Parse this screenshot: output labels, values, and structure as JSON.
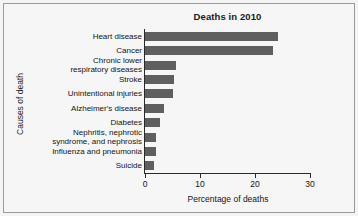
{
  "chart_data": {
    "type": "bar",
    "orientation": "horizontal",
    "title": "Deaths in 2010",
    "xlabel": "Percentage of deaths",
    "ylabel": "Causes of death",
    "categories": [
      "Heart disease",
      "Cancer",
      "Chronic lower respiratory diseases",
      "Stroke",
      "Unintentional injuries",
      "Alzheimer's disease",
      "Diabetes",
      "Nephritis, nephrotic syndrome, and nephrosis",
      "Influenza and pneumonia",
      "Suicide"
    ],
    "values": [
      24.2,
      23.3,
      5.6,
      5.3,
      5.0,
      3.4,
      2.8,
      2.0,
      2.0,
      1.6
    ],
    "xlim": [
      0,
      30
    ],
    "xticks": [
      0,
      10,
      20,
      30
    ],
    "xtick_labels": [
      "0",
      "10",
      "20",
      "30"
    ],
    "grid": false,
    "legend": false,
    "bar_color": "#5f5f5f",
    "background_color": "#f6f6f6",
    "axis_color": "#2a2a2a"
  },
  "category_label_lines": [
    [
      "Heart disease"
    ],
    [
      "Cancer"
    ],
    [
      "Chronic lower",
      "respiratory diseases"
    ],
    [
      "Stroke"
    ],
    [
      "Unintentional injuries"
    ],
    [
      "Alzheimer's disease"
    ],
    [
      "Diabetes"
    ],
    [
      "Nephritis, nephrotic",
      "syndrome, and nephrosis"
    ],
    [
      "Influenza and pneumonia"
    ],
    [
      "Suicide"
    ]
  ]
}
